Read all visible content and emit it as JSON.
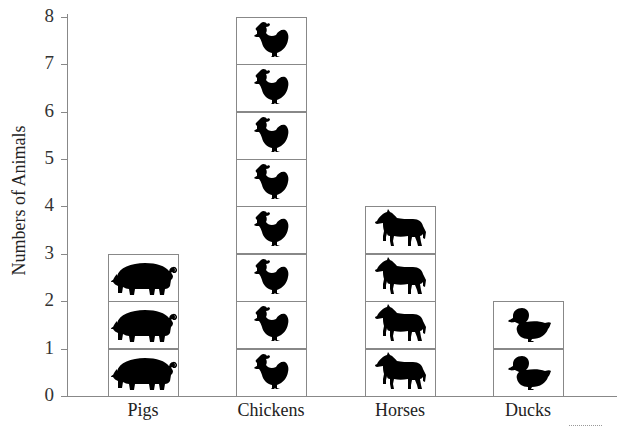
{
  "chart_data": {
    "type": "bar",
    "style": "pictograph",
    "title": "",
    "xlabel": "",
    "ylabel": "Numbers of Animals",
    "ylim": [
      0,
      8
    ],
    "yticks": [
      "0",
      "1",
      "2",
      "3",
      "4",
      "5",
      "6",
      "7",
      "8"
    ],
    "grid": false,
    "legend": null,
    "categories": [
      "Pigs",
      "Chickens",
      "Horses",
      "Ducks"
    ],
    "values": [
      3,
      8,
      4,
      2
    ],
    "icons": [
      "pig-icon",
      "chicken-icon",
      "horse-icon",
      "duck-icon"
    ],
    "colors": {
      "icon": "#000000",
      "box_border": "#888888",
      "axis": "#888888"
    }
  },
  "axis": {
    "ylabel": "Numbers of Animals",
    "yticks": [
      "0",
      "1",
      "2",
      "3",
      "4",
      "5",
      "6",
      "7",
      "8"
    ]
  },
  "categories": [
    {
      "label": "Pigs",
      "count": 3,
      "icon": "pig-icon"
    },
    {
      "label": "Chickens",
      "count": 8,
      "icon": "chicken-icon"
    },
    {
      "label": "Horses",
      "count": 4,
      "icon": "horse-icon"
    },
    {
      "label": "Ducks",
      "count": 2,
      "icon": "duck-icon"
    }
  ]
}
